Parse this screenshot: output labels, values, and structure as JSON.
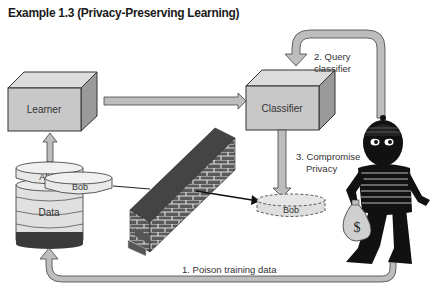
{
  "title": "Example 1.3 (Privacy-Preserving Learning)",
  "nodes": {
    "learner": "Learner",
    "classifier": "Classifier",
    "alice": "Alice",
    "bob": "Bob",
    "data": "Data",
    "bob_leaked": "Bob"
  },
  "steps": {
    "step1": "1. Poison training data",
    "step2_line1": "2. Query",
    "step2_line2": "classifier",
    "step3_line1": "3. Compromise",
    "step3_line2": "Privacy"
  },
  "icons": {
    "wall": "brick-wall-icon",
    "attacker": "burglar-icon",
    "money_bag": "money-bag-icon",
    "money_symbol": "$"
  },
  "colors": {
    "box_front": "#c8c8c8",
    "box_top": "#dcdcdc",
    "box_side": "#9a9a9a",
    "arrow_fill": "#bdbdbd",
    "brick": "#555555",
    "data_band": "#3a3a3a"
  }
}
